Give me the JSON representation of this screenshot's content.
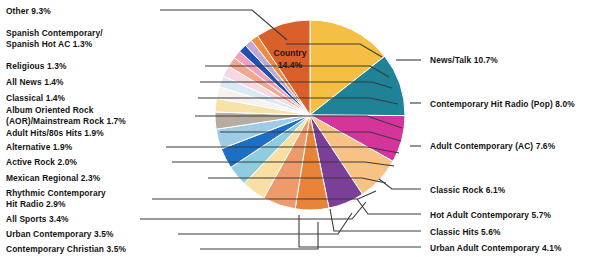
{
  "chart_data": {
    "type": "pie",
    "title": "",
    "legend_position": "outside-callouts",
    "units": "percent",
    "center": {
      "cx": 310,
      "cy": 115,
      "r": 95
    },
    "start_angle_deg": -90,
    "direction": "clockwise",
    "inside_label": {
      "name": "Country",
      "value_text": "14.4%",
      "x": 290,
      "y": 62
    },
    "categories": [
      "Country",
      "News/Talk",
      "Contemporary Hit Radio (Pop)",
      "Adult Contemporary (AC)",
      "Classic Rock",
      "Hot Adult Contemporary",
      "Classic Hits",
      "Urban Adult Contemporary",
      "Contemporary Christian",
      "Urban Contemporary",
      "All Sports",
      "Rhythmic Contemporary Hit Radio",
      "Mexican Regional",
      "Active Rock",
      "Alternative",
      "Adult Hits/80s Hits",
      "Album Oriented Rock (AOR)/Mainstream Rock",
      "Classical",
      "All News",
      "Religious",
      "Spanish Contemporary/Spanish Hot AC",
      "Other"
    ],
    "values": [
      14.4,
      10.7,
      8.0,
      7.6,
      6.1,
      5.7,
      5.6,
      4.1,
      3.5,
      3.5,
      3.4,
      2.9,
      2.3,
      2.0,
      1.9,
      1.9,
      1.7,
      1.4,
      1.4,
      1.3,
      1.3,
      9.3
    ],
    "colors": [
      "#f4bf43",
      "#1f8296",
      "#d5359a",
      "#f8c285",
      "#7b3f98",
      "#e8833a",
      "#ef9a6a",
      "#f8dfa3",
      "#8ecde0",
      "#1b6fc4",
      "#9ecce6",
      "#b8aca0",
      "#f7e2a8",
      "#f6f2ef",
      "#dbe9f5",
      "#f9d7e2",
      "#f2a88f",
      "#f3a0c0",
      "#1f4fb0",
      "#c0a8d8",
      "#f08a3c",
      "#d95f2b"
    ],
    "slices": [
      {
        "label": "Country 14.4%",
        "name": "Country",
        "value": 14.4,
        "color": "#f4bf43"
      },
      {
        "label": "News/Talk 10.7%",
        "name": "News/Talk",
        "value": 10.7,
        "color": "#1f8296"
      },
      {
        "label": "Contemporary Hit Radio (Pop) 8.0%",
        "name": "Contemporary Hit Radio (Pop)",
        "value": 8.0,
        "color": "#d5359a"
      },
      {
        "label": "Adult Contemporary (AC) 7.6%",
        "name": "Adult Contemporary (AC)",
        "value": 7.6,
        "color": "#f8c285"
      },
      {
        "label": "Classic Rock 6.1%",
        "name": "Classic Rock",
        "value": 6.1,
        "color": "#7b3f98"
      },
      {
        "label": "Hot Adult Contemporary 5.7%",
        "name": "Hot Adult Contemporary",
        "value": 5.7,
        "color": "#e8833a"
      },
      {
        "label": "Classic Hits 5.6%",
        "name": "Classic Hits",
        "value": 5.6,
        "color": "#ef9a6a"
      },
      {
        "label": "Urban Adult Contemporary 4.1%",
        "name": "Urban Adult Contemporary",
        "value": 4.1,
        "color": "#f8dfa3"
      },
      {
        "label": "Contemporary Christian 3.5%",
        "name": "Contemporary Christian",
        "value": 3.5,
        "color": "#8ecde0"
      },
      {
        "label": "Urban Contemporary 3.5%",
        "name": "Urban Contemporary",
        "value": 3.5,
        "color": "#1b6fc4"
      },
      {
        "label": "All Sports 3.4%",
        "name": "All Sports",
        "value": 3.4,
        "color": "#9ecce6"
      },
      {
        "label": "Rhythmic Contemporary Hit Radio 2.9%",
        "name": "Rhythmic Contemporary Hit Radio",
        "value": 2.9,
        "color": "#b8aca0"
      },
      {
        "label": "Mexican Regional 2.3%",
        "name": "Mexican Regional",
        "value": 2.3,
        "color": "#f7e2a8"
      },
      {
        "label": "Active Rock 2.0%",
        "name": "Active Rock",
        "value": 2.0,
        "color": "#f6f2ef"
      },
      {
        "label": "Alternative 1.9%",
        "name": "Alternative",
        "value": 1.9,
        "color": "#dbe9f5"
      },
      {
        "label": "Adult Hits/80s Hits 1.9%",
        "name": "Adult Hits/80s Hits",
        "value": 1.9,
        "color": "#f9d7e2"
      },
      {
        "label": "Album Oriented Rock (AOR)/Mainstream Rock 1.7%",
        "name": "Album Oriented Rock (AOR)/Mainstream Rock",
        "value": 1.7,
        "color": "#f2a88f"
      },
      {
        "label": "Classical 1.4%",
        "name": "Classical",
        "value": 1.4,
        "color": "#f3a0c0"
      },
      {
        "label": "All News 1.4%",
        "name": "All News",
        "value": 1.4,
        "color": "#1f4fb0"
      },
      {
        "label": "Religious 1.3%",
        "name": "Religious",
        "value": 1.3,
        "color": "#c0a8d8"
      },
      {
        "label": "Spanish Contemporary/Spanish Hot AC 1.3%",
        "name": "Spanish Contemporary/Spanish Hot AC",
        "value": 1.3,
        "color": "#f08a3c"
      },
      {
        "label": "Other 9.3%",
        "name": "Other",
        "value": 9.3,
        "color": "#d95f2b"
      }
    ]
  },
  "labels_left": [
    {
      "line1": "Other 9.3%",
      "line2": "",
      "x": 6,
      "y": 6
    },
    {
      "line1": "Spanish Contemporary/",
      "line2": "Spanish Hot AC 1.3%",
      "x": 6,
      "y": 28
    },
    {
      "line1": "Religious 1.3%",
      "line2": "",
      "x": 6,
      "y": 61
    },
    {
      "line1": "All News 1.4%",
      "line2": "",
      "x": 6,
      "y": 77
    },
    {
      "line1": "Classical 1.4%",
      "line2": "",
      "x": 6,
      "y": 93
    },
    {
      "line1": "Album Oriented Rock",
      "line2": "(AOR)/Mainstream Rock 1.7%",
      "x": 6,
      "y": 105
    },
    {
      "line1": "Adult Hits/80s Hits 1.9%",
      "line2": "",
      "x": 6,
      "y": 128
    },
    {
      "line1": "Alternative 1.9%",
      "line2": "",
      "x": 6,
      "y": 142
    },
    {
      "line1": "Active Rock 2.0%",
      "line2": "",
      "x": 6,
      "y": 157
    },
    {
      "line1": "Mexican Regional 2.3%",
      "line2": "",
      "x": 6,
      "y": 173
    },
    {
      "line1": "Rhythmic Contemporary",
      "line2": "Hit Radio 2.9%",
      "x": 6,
      "y": 188
    },
    {
      "line1": "All Sports 3.4%",
      "line2": "",
      "x": 6,
      "y": 214
    },
    {
      "line1": "Urban Contemporary 3.5%",
      "line2": "",
      "x": 6,
      "y": 229
    },
    {
      "line1": "Contemporary Christian 3.5%",
      "line2": "",
      "x": 6,
      "y": 244
    }
  ],
  "labels_right": [
    {
      "line1": "News/Talk 10.7%",
      "x": 430,
      "y": 55
    },
    {
      "line1": "Contemporary Hit Radio (Pop) 8.0%",
      "x": 430,
      "y": 99
    },
    {
      "line1": "Adult Contemporary (AC) 7.6%",
      "x": 430,
      "y": 141
    },
    {
      "line1": "Classic Rock 6.1%",
      "x": 430,
      "y": 185
    },
    {
      "line1": "Hot Adult Contemporary 5.7%",
      "x": 430,
      "y": 210
    },
    {
      "line1": "Classic Hits 5.6%",
      "x": 430,
      "y": 227
    },
    {
      "line1": "Urban Adult Contemporary 4.1%",
      "x": 430,
      "y": 243
    }
  ]
}
